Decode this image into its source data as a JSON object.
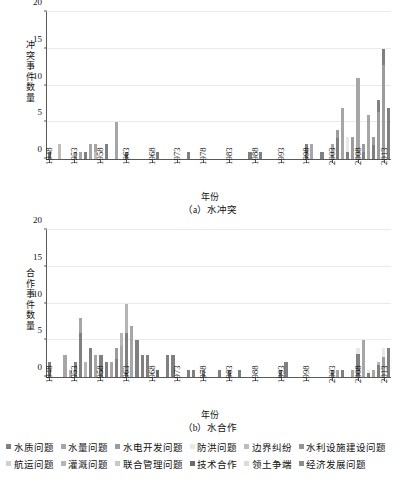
{
  "figure": {
    "xaxis_title": "年份",
    "caption_a": "（a）水冲突",
    "caption_b": "（b）水合作"
  },
  "legend": {
    "rows": [
      [
        {
          "label": "水质问题",
          "color": "#808080"
        },
        {
          "label": "水量问题",
          "color": "#a6a6a6"
        },
        {
          "label": "水电开发问题",
          "color": "#9c9c9c"
        },
        {
          "label": "防洪问题",
          "color": "#e8e8e8"
        },
        {
          "label": "边界纠纷",
          "color": "#bdbdbd"
        },
        {
          "label": "水利设施建设问题",
          "color": "#949494"
        }
      ],
      [
        {
          "label": "航运问题",
          "color": "#d0d0d0"
        },
        {
          "label": "灌溉问题",
          "color": "#b5b5b5"
        },
        {
          "label": "联合管理问题",
          "color": "#c8c8c8"
        },
        {
          "label": "技术合作",
          "color": "#6b6b6b"
        },
        {
          "label": "领土争端",
          "color": "#dcdcdc"
        },
        {
          "label": "经济发展问题",
          "color": "#8c8c8c"
        }
      ]
    ]
  },
  "chart_data": [
    {
      "type": "bar",
      "stacked": true,
      "id": "water-conflict",
      "title": "（a）水冲突",
      "xlabel": "年份",
      "ylabel": "冲突事件数量",
      "ylim": [
        0,
        20
      ],
      "yticks": [
        0,
        5,
        10,
        15,
        20
      ],
      "grid": true,
      "xlim": [
        1948,
        2014
      ],
      "xticks": [
        1948,
        1953,
        1958,
        1963,
        1968,
        1973,
        1978,
        1983,
        1988,
        1993,
        1998,
        2003,
        2008,
        2013
      ],
      "series_names": [
        "水质问题",
        "水量问题",
        "水电开发问题",
        "防洪问题",
        "边界纠纷",
        "水利设施建设问题",
        "航运问题",
        "灌溉问题",
        "联合管理问题",
        "技术合作",
        "领土争端",
        "经济发展问题"
      ],
      "categories": [
        1948,
        1949,
        1950,
        1951,
        1952,
        1953,
        1954,
        1955,
        1956,
        1957,
        1958,
        1959,
        1960,
        1961,
        1962,
        1963,
        1964,
        1965,
        1966,
        1967,
        1968,
        1969,
        1970,
        1971,
        1972,
        1973,
        1974,
        1975,
        1976,
        1977,
        1978,
        1979,
        1980,
        1981,
        1982,
        1983,
        1984,
        1985,
        1986,
        1987,
        1988,
        1989,
        1990,
        1991,
        1992,
        1993,
        1994,
        1995,
        1996,
        1997,
        1998,
        1999,
        2000,
        2001,
        2002,
        2003,
        2004,
        2005,
        2006,
        2007,
        2008,
        2009,
        2010,
        2011,
        2012,
        2013,
        2014
      ],
      "values": [
        1,
        0,
        2,
        0,
        0,
        1,
        1,
        1,
        2,
        2,
        0,
        2,
        0,
        5,
        0,
        1,
        0,
        0,
        0,
        0,
        0,
        1,
        0,
        0,
        0,
        0,
        0,
        1,
        0,
        0,
        0,
        0,
        0,
        0,
        0,
        0,
        0,
        0,
        0,
        1,
        0,
        1,
        0,
        0,
        0,
        0,
        0,
        0,
        0,
        0,
        2,
        2,
        0,
        1,
        0,
        2,
        4,
        7,
        3,
        3,
        11,
        2,
        6,
        3,
        8,
        15,
        7,
        14,
        19,
        9,
        8,
        13,
        12,
        1,
        8,
        7
      ],
      "stack_breakdown": [
        {
          "year": 1948,
          "segments": [
            {
              "series": "水质问题",
              "value": 1
            }
          ]
        },
        {
          "year": 1950,
          "segments": [
            {
              "series": "边界纠纷",
              "value": 2
            }
          ]
        },
        {
          "year": 1953,
          "segments": [
            {
              "series": "水量问题",
              "value": 1
            }
          ]
        },
        {
          "year": 1954,
          "segments": [
            {
              "series": "水量问题",
              "value": 1
            }
          ]
        },
        {
          "year": 1955,
          "segments": [
            {
              "series": "水质问题",
              "value": 1
            }
          ]
        },
        {
          "year": 1956,
          "segments": [
            {
              "series": "水量问题",
              "value": 2
            }
          ]
        },
        {
          "year": 1957,
          "segments": [
            {
              "series": "边界纠纷",
              "value": 1
            },
            {
              "series": "水量问题",
              "value": 1
            }
          ]
        },
        {
          "year": 1959,
          "segments": [
            {
              "series": "水质问题",
              "value": 2
            }
          ]
        },
        {
          "year": 1961,
          "segments": [
            {
              "series": "水量问题",
              "value": 5
            }
          ]
        },
        {
          "year": 1962,
          "segments": [
            {
              "series": "边界纠纷",
              "value": 1
            }
          ]
        },
        {
          "year": 1965,
          "segments": [
            {
              "series": "水量问题",
              "value": 1
            }
          ]
        },
        {
          "year": 1971,
          "segments": [
            {
              "series": "防洪问题",
              "value": 1
            }
          ]
        },
        {
          "year": 1986,
          "segments": [
            {
              "series": "水量问题",
              "value": 1
            }
          ]
        },
        {
          "year": 1988,
          "segments": [
            {
              "series": "领土争端",
              "value": 1
            }
          ]
        },
        {
          "year": 1998,
          "segments": [
            {
              "series": "水质问题",
              "value": 2
            }
          ]
        },
        {
          "year": 1999,
          "segments": [
            {
              "series": "水量问题",
              "value": 2
            }
          ]
        },
        {
          "year": 2000,
          "segments": [
            {
              "series": "防洪问题",
              "value": 1
            }
          ]
        },
        {
          "year": 2002,
          "segments": [
            {
              "series": "水质问题",
              "value": 2
            }
          ]
        },
        {
          "year": 2003,
          "segments": [
            {
              "series": "水量问题",
              "value": 4
            }
          ]
        },
        {
          "year": 2004,
          "segments": [
            {
              "series": "水质问题",
              "value": 5
            },
            {
              "series": "水电开发问题",
              "value": 2
            }
          ]
        },
        {
          "year": 2005,
          "segments": [
            {
              "series": "水量问题",
              "value": 3
            }
          ]
        },
        {
          "year": 2006,
          "segments": [
            {
              "series": "水质问题",
              "value": 1
            },
            {
              "series": "防洪问题",
              "value": 2
            }
          ]
        },
        {
          "year": 2007,
          "segments": [
            {
              "series": "水电开发问题",
              "value": 11
            }
          ]
        },
        {
          "year": 2008,
          "segments": [
            {
              "series": "水量问题",
              "value": 2
            }
          ]
        },
        {
          "year": 2009,
          "segments": [
            {
              "series": "水质问题",
              "value": 3
            },
            {
              "series": "水电开发问题",
              "value": 3
            }
          ]
        },
        {
          "year": 2010,
          "segments": [
            {
              "series": "水量问题",
              "value": 3
            }
          ]
        },
        {
          "year": 2011,
          "segments": [
            {
              "series": "水质问题",
              "value": 5
            },
            {
              "series": "水电开发问题",
              "value": 3
            }
          ]
        },
        {
          "year": 2012,
          "segments": [
            {
              "series": "水电开发问题",
              "value": 12
            },
            {
              "series": "水质问题",
              "value": 3
            }
          ]
        },
        {
          "year": 2013,
          "segments": [
            {
              "series": "水电开发问题",
              "value": 6
            },
            {
              "series": "水质问题",
              "value": 1
            }
          ]
        }
      ]
    },
    {
      "type": "bar",
      "stacked": true,
      "id": "water-cooperation",
      "title": "（b）水合作",
      "xlabel": "年份",
      "ylabel": "合作事件数量",
      "ylim": [
        0,
        20
      ],
      "yticks": [
        0,
        5,
        10,
        15,
        20
      ],
      "grid": true,
      "xlim": [
        1948,
        2014
      ],
      "xticks": [
        1948,
        1953,
        1958,
        1963,
        1968,
        1973,
        1978,
        1983,
        1988,
        1993,
        1998,
        2003,
        2008,
        2013
      ],
      "series_names": [
        "水质问题",
        "水量问题",
        "水电开发问题",
        "防洪问题",
        "边界纠纷",
        "水利设施建设问题",
        "航运问题",
        "灌溉问题",
        "联合管理问题",
        "技术合作",
        "领土争端",
        "经济发展问题"
      ],
      "categories": [
        1948,
        1949,
        1950,
        1951,
        1952,
        1953,
        1954,
        1955,
        1956,
        1957,
        1958,
        1959,
        1960,
        1961,
        1962,
        1963,
        1964,
        1965,
        1966,
        1967,
        1968,
        1969,
        1970,
        1971,
        1972,
        1973,
        1974,
        1975,
        1976,
        1977,
        1978,
        1979,
        1980,
        1981,
        1982,
        1983,
        1984,
        1985,
        1986,
        1987,
        1988,
        1989,
        1990,
        1991,
        1992,
        1993,
        1994,
        1995,
        1996,
        1997,
        1998,
        1999,
        2000,
        2001,
        2002,
        2003,
        2004,
        2005,
        2006,
        2007,
        2008,
        2009,
        2010,
        2011,
        2012,
        2013,
        2014
      ],
      "values": [
        2,
        0,
        0,
        3,
        1,
        2,
        8,
        2,
        4,
        3,
        3,
        2,
        2,
        4,
        6,
        10,
        7,
        5,
        3,
        3,
        0,
        1,
        0,
        3,
        3,
        0,
        0,
        1,
        1,
        0,
        1,
        0,
        0,
        1,
        0,
        1,
        0,
        1,
        0,
        0,
        0,
        0,
        0,
        0,
        0,
        1,
        2,
        0,
        0,
        0,
        0,
        0,
        0,
        0,
        0,
        1,
        1,
        1,
        0,
        1,
        4,
        5,
        1,
        1,
        2,
        4,
        4,
        4,
        6,
        9,
        1,
        0,
        3,
        4
      ],
      "stack_breakdown": [
        {
          "year": 1948,
          "segments": [
            {
              "series": "水质问题",
              "value": 2
            }
          ]
        },
        {
          "year": 1951,
          "segments": [
            {
              "series": "水量问题",
              "value": 3
            }
          ]
        },
        {
          "year": 1952,
          "segments": [
            {
              "series": "灌溉问题",
              "value": 1
            }
          ]
        },
        {
          "year": 1954,
          "segments": [
            {
              "series": "水质问题",
              "value": 6
            },
            {
              "series": "水量问题",
              "value": 2
            }
          ]
        },
        {
          "year": 1955,
          "segments": [
            {
              "series": "灌溉问题",
              "value": 2
            }
          ]
        },
        {
          "year": 1956,
          "segments": [
            {
              "series": "水质问题",
              "value": 4
            }
          ]
        },
        {
          "year": 1957,
          "segments": [
            {
              "series": "水量问题",
              "value": 3
            }
          ]
        },
        {
          "year": 1959,
          "segments": [
            {
              "series": "水质问题",
              "value": 2
            }
          ]
        },
        {
          "year": 1960,
          "segments": [
            {
              "series": "水量问题",
              "value": 4
            }
          ]
        },
        {
          "year": 1961,
          "segments": [
            {
              "series": "水质问题",
              "value": 6
            },
            {
              "series": "水电开发问题",
              "value": 4
            }
          ]
        },
        {
          "year": 1962,
          "segments": [
            {
              "series": "水量问题",
              "value": 5
            },
            {
              "series": "灌溉问题",
              "value": 2
            }
          ]
        },
        {
          "year": 1963,
          "segments": [
            {
              "series": "水质问题",
              "value": 3
            },
            {
              "series": "灌溉问题",
              "value": 2
            }
          ]
        },
        {
          "year": 1964,
          "segments": [
            {
              "series": "水量问题",
              "value": 3
            }
          ]
        },
        {
          "year": 1967,
          "segments": [
            {
              "series": "水质问题",
              "value": 1
            }
          ]
        },
        {
          "year": 1969,
          "segments": [
            {
              "series": "技术合作",
              "value": 3
            }
          ]
        },
        {
          "year": 1970,
          "segments": [
            {
              "series": "技术合作",
              "value": 3
            }
          ]
        },
        {
          "year": 1973,
          "segments": [
            {
              "series": "水质问题",
              "value": 1
            }
          ]
        },
        {
          "year": 1974,
          "segments": [
            {
              "series": "水量问题",
              "value": 1
            }
          ]
        },
        {
          "year": 1978,
          "segments": [
            {
              "series": "水质问题",
              "value": 1
            }
          ]
        },
        {
          "year": 1988,
          "segments": [
            {
              "series": "领土争端",
              "value": 1
            }
          ]
        },
        {
          "year": 1990,
          "segments": [
            {
              "series": "技术合作",
              "value": 2
            }
          ]
        },
        {
          "year": 2002,
          "segments": [
            {
              "series": "水质问题",
              "value": 1
            }
          ]
        },
        {
          "year": 2004,
          "segments": [
            {
              "series": "水量问题",
              "value": 1
            }
          ]
        },
        {
          "year": 2006,
          "segments": [
            {
              "series": "水质问题",
              "value": 1
            }
          ]
        },
        {
          "year": 2007,
          "segments": [
            {
              "series": "水量问题",
              "value": 4
            }
          ]
        },
        {
          "year": 2008,
          "segments": [
            {
              "series": "水质问题",
              "value": 4
            },
            {
              "series": "防洪问题",
              "value": 1
            }
          ]
        },
        {
          "year": 2009,
          "segments": [
            {
              "series": "水量问题",
              "value": 1
            }
          ]
        },
        {
          "year": 2010,
          "segments": [
            {
              "series": "水质问题",
              "value": 1
            },
            {
              "series": "防洪问题",
              "value": 1
            }
          ]
        },
        {
          "year": 2011,
          "segments": [
            {
              "series": "水量问题",
              "value": 4
            }
          ]
        },
        {
          "year": 2012,
          "segments": [
            {
              "series": "水质问题",
              "value": 4
            },
            {
              "series": "灌溉问题",
              "value": 1
            }
          ]
        },
        {
          "year": 2013,
          "segments": [
            {
              "series": "水电开发问题",
              "value": 6
            },
            {
              "series": "防洪问题",
              "value": 3
            }
          ]
        }
      ]
    }
  ]
}
